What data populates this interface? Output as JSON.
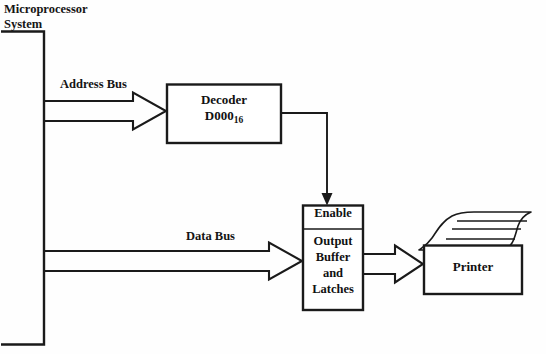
{
  "diagram": {
    "background_color": "#fefefe",
    "line_color": "#1a1a1a",
    "text_color": "#151515"
  },
  "system": {
    "label_line1": "Microprocessor",
    "label_line2": "System",
    "shape": "open-left-rectangle"
  },
  "buses": [
    {
      "name": "address-bus",
      "label": "Address Bus",
      "style": "hollow-block-arrow",
      "from": "microprocessor-system",
      "to": "decoder"
    },
    {
      "name": "data-bus",
      "label": "Data Bus",
      "style": "hollow-block-arrow",
      "from": "microprocessor-system",
      "to": "output-buffer"
    }
  ],
  "blocks": {
    "decoder": {
      "line1": "Decoder",
      "line2_base": "D000",
      "line2_subscript": "16"
    },
    "output_buffer": {
      "enable_label": "Enable",
      "body_line1": "Output",
      "body_line2": "Buffer",
      "body_line3": "and",
      "body_line4": "Latches"
    },
    "printer": {
      "label": "Printer",
      "paper_lines": 3
    }
  },
  "connections": [
    {
      "name": "decoder-enable-line",
      "style": "thin-line-solid-arrowhead",
      "from": "decoder",
      "to": "output-buffer-enable"
    },
    {
      "name": "buffer-printer-arrow",
      "style": "hollow-block-arrow",
      "from": "output-buffer",
      "to": "printer"
    }
  ]
}
